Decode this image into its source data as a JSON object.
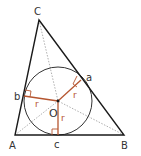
{
  "colors": {
    "triangle": "#1a1a1a",
    "circle": "#333333",
    "bisector": "#9a9a9a",
    "radius": "#b5552f",
    "right_angle": "#b5552f",
    "label": "#333333"
  },
  "vertices": {
    "A": {
      "label": "A",
      "x": 15,
      "y": 135
    },
    "B": {
      "label": "B",
      "x": 124,
      "y": 135
    },
    "C": {
      "label": "C",
      "x": 39,
      "y": 20
    }
  },
  "incenter": {
    "label": "O",
    "x": 58,
    "y": 101
  },
  "radius": 34,
  "tangent_points": {
    "a": {
      "label": "a",
      "x": 81,
      "y": 80
    },
    "b": {
      "label": "b",
      "x": 24,
      "y": 96
    },
    "c": {
      "label": "c",
      "x": 58,
      "y": 135
    }
  },
  "radius_label": "r"
}
